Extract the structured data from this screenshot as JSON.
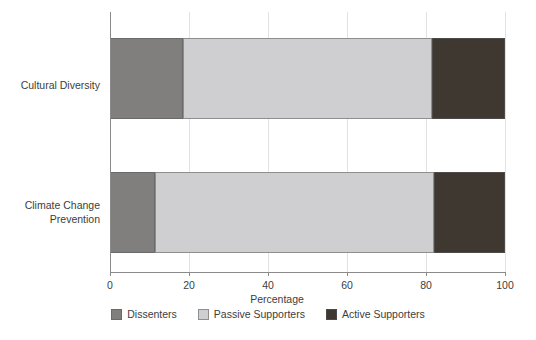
{
  "chart_data": {
    "type": "bar",
    "orientation": "horizontal",
    "stacked": true,
    "stack_mode": "percent",
    "title": "",
    "subtitle": "",
    "xlabel": "Percentage",
    "ylabel": "",
    "xlim": [
      0,
      100
    ],
    "xticks": [
      0,
      20,
      40,
      60,
      80,
      100
    ],
    "xtick_labels": [
      "0",
      "20",
      "40",
      "60",
      "80",
      "100"
    ],
    "grid": true,
    "grid_axis": "x",
    "legend_position": "bottom",
    "categories": [
      "Cultural Diversity",
      "Climate Change\nPrevention"
    ],
    "category_labels_plain": [
      "Cultural Diversity",
      "Climate Change Prevention"
    ],
    "series": [
      {
        "name": "Dissenters",
        "color": "#807f7e",
        "values": [
          18.5,
          11.5
        ]
      },
      {
        "name": "Passive Supporters",
        "color": "#cfcfd1",
        "values": [
          63.0,
          70.5
        ]
      },
      {
        "name": "Active Supporters",
        "color": "#3e3831",
        "values": [
          18.5,
          18.0
        ]
      }
    ]
  },
  "colors": {
    "dissenters": "#807f7e",
    "passive_supporters": "#cfcfd1",
    "active_supporters": "#3e3831",
    "axis": "#8a8a8a",
    "gridline": "#e2e2e2",
    "text": "#3d3d3d",
    "background": "#ffffff"
  },
  "axis": {
    "x_title": "Percentage",
    "tick_labels": [
      "0",
      "20",
      "40",
      "60",
      "80",
      "100"
    ]
  },
  "legend": {
    "items": [
      {
        "label": "Dissenters",
        "color": "#807f7e"
      },
      {
        "label": "Passive Supporters",
        "color": "#cfcfd1"
      },
      {
        "label": "Active Supporters",
        "color": "#3e3831"
      }
    ]
  }
}
